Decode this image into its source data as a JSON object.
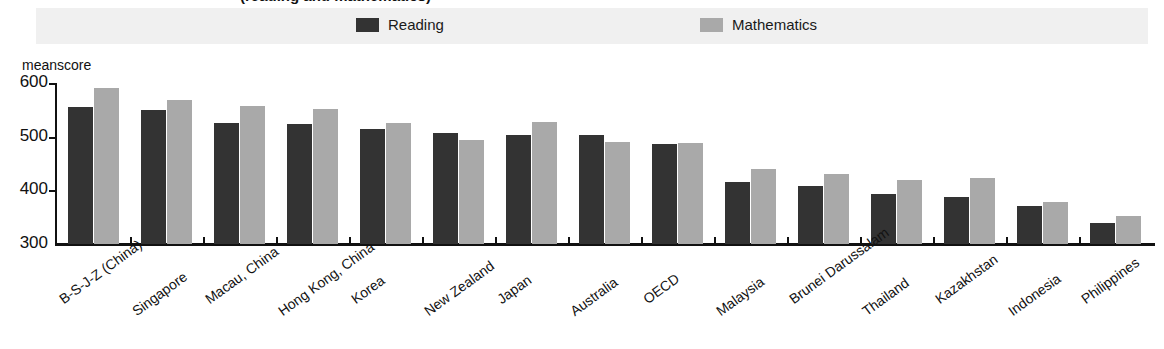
{
  "title_partial": "(reading and mathematics)",
  "axis": {
    "unit_label": "meanscore",
    "yticks": [
      "600",
      "500",
      "400",
      "300"
    ]
  },
  "legend": {
    "entries": [
      {
        "label": "Reading",
        "color": "#333333",
        "swatch_name": "reading-swatch"
      },
      {
        "label": "Mathematics",
        "color": "#a9a9a9",
        "swatch_name": "mathematics-swatch"
      }
    ]
  },
  "chart_data": {
    "type": "bar",
    "title": "(reading and mathematics)",
    "xlabel": "",
    "ylabel": "meanscore",
    "ylim": [
      300,
      600
    ],
    "yticks": [
      300,
      400,
      500,
      600
    ],
    "grid": false,
    "legend_position": "top",
    "categories": [
      "B-S-J-Z (China)",
      "Singapore",
      "Macau, China",
      "Hong Kong, China",
      "Korea",
      "New Zealand",
      "Japan",
      "Australia",
      "OECD",
      "Malaysia",
      "Brunei Darussalam",
      "Thailand",
      "Kazakhstan",
      "Indonesia",
      "Philippines"
    ],
    "series": [
      {
        "name": "Reading",
        "color": "#333333",
        "values": [
          555,
          549,
          525,
          524,
          514,
          506,
          504,
          503,
          487,
          415,
          408,
          393,
          387,
          371,
          340
        ]
      },
      {
        "name": "Mathematics",
        "color": "#a9a9a9",
        "values": [
          591,
          569,
          558,
          551,
          526,
          494,
          527,
          491,
          489,
          440,
          430,
          419,
          423,
          379,
          353
        ]
      }
    ]
  }
}
